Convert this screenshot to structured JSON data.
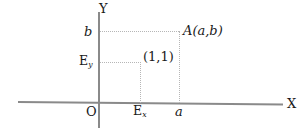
{
  "figure": {
    "axes": {
      "y_label": "Y",
      "x_label": "X",
      "origin_label": "O"
    },
    "tick_labels": {
      "y_b": "b",
      "y_ey": "E",
      "y_ey_sub": "y",
      "x_a": "a",
      "x_ex": "E",
      "x_ex_sub": "x"
    },
    "points": {
      "point_a": "A(a,b)",
      "unit_point": "(1,1)"
    },
    "colors": {
      "axis": "#8a8a8a",
      "guide": "#b6b6b6",
      "text": "#1a1a1a",
      "background": "#ffffff"
    }
  }
}
